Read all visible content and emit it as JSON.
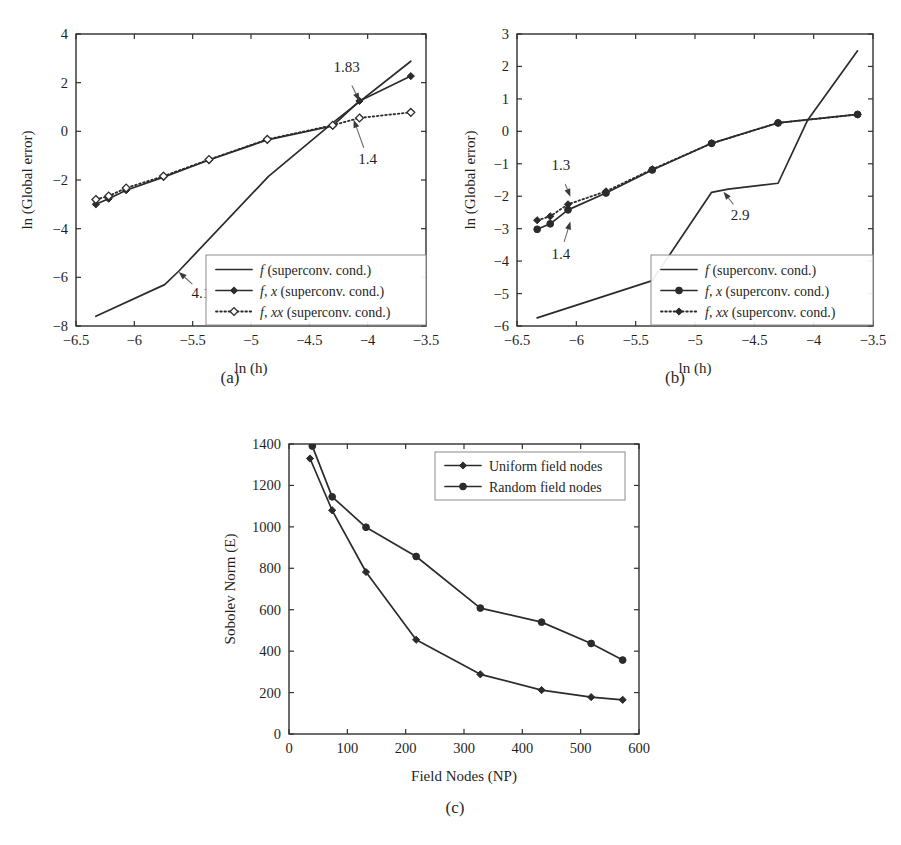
{
  "figure": {
    "captions": {
      "a": "(a)",
      "b": "(b)",
      "c": "(c)"
    }
  },
  "chart_data": [
    {
      "id": "a",
      "type": "line",
      "title": "",
      "caption": "(a)",
      "xlabel": "ln (h)",
      "ylabel": "ln (Global error)",
      "xlim": [
        -6.5,
        -3.5
      ],
      "ylim": [
        -8,
        4
      ],
      "xticks": [
        -6.5,
        -6,
        -5.5,
        -5,
        -4.5,
        -4,
        -3.5
      ],
      "xticklabels": [
        "−6.5",
        "−6",
        "−5.5",
        "−5",
        "−4.5",
        "−4",
        "−3.5"
      ],
      "yticks": [
        -8,
        -6,
        -4,
        -2,
        0,
        2,
        4
      ],
      "yticklabels": [
        "−8",
        "−6",
        "−4",
        "−2",
        "0",
        "2",
        "4"
      ],
      "grid": false,
      "legend_position": "lower right",
      "series": [
        {
          "name": "f (superconv. cond.)",
          "name_parts": {
            "italic": "f",
            "rest": " (superconv. cond.)"
          },
          "style": "solid",
          "marker": "none",
          "x": [
            -6.33,
            -5.74,
            -5.62,
            -4.85,
            -4.3,
            -3.63
          ],
          "y": [
            -7.6,
            -6.3,
            -5.75,
            -1.85,
            0.35,
            2.88
          ]
        },
        {
          "name": "f, x (superconv. cond.)",
          "name_parts": {
            "italic": "f",
            "mid": ", ",
            "italic2": "x",
            "rest": " (superconv. cond.)"
          },
          "style": "solid",
          "marker": "filled-diamond",
          "x": [
            -6.33,
            -6.22,
            -6.07,
            -5.75,
            -5.36,
            -4.86,
            -4.3,
            -4.07,
            -3.63
          ],
          "y": [
            -3.0,
            -2.77,
            -2.42,
            -1.88,
            -1.18,
            -0.35,
            0.22,
            1.25,
            2.27
          ]
        },
        {
          "name": "f, xx (superconv. cond.)",
          "name_parts": {
            "italic": "f",
            "mid": ", ",
            "italic2": "xx",
            "rest": " (superconv. cond.)"
          },
          "style": "dotted",
          "marker": "open-diamond",
          "x": [
            -6.33,
            -6.22,
            -6.07,
            -5.75,
            -5.36,
            -4.86,
            -4.3,
            -4.07,
            -3.63
          ],
          "y": [
            -2.8,
            -2.66,
            -2.33,
            -1.84,
            -1.16,
            -0.33,
            0.25,
            0.55,
            0.78
          ]
        }
      ],
      "annotations": [
        {
          "label": "1.83",
          "text_x": -4.18,
          "text_y": 2.45,
          "point_x": -4.07,
          "point_y": 1.25
        },
        {
          "label": "1.4",
          "text_x": -4.0,
          "text_y": -1.35,
          "point_x": -4.12,
          "point_y": 0.48
        },
        {
          "label": "4.1",
          "text_x": -5.43,
          "text_y": -6.85,
          "point_x": -5.62,
          "point_y": -5.78
        }
      ]
    },
    {
      "id": "b",
      "type": "line",
      "title": "",
      "caption": "(b)",
      "xlabel": "ln (h)",
      "ylabel": "ln (Global error)",
      "xlim": [
        -6.5,
        -3.5
      ],
      "ylim": [
        -6,
        3
      ],
      "xticks": [
        -6.5,
        -6,
        -5.5,
        -5,
        -4.5,
        -4,
        -3.5
      ],
      "xticklabels": [
        "−6.5",
        "−6",
        "−5.5",
        "−5",
        "−4.5",
        "−4",
        "−3.5"
      ],
      "yticks": [
        -6,
        -5,
        -4,
        -3,
        -2,
        -1,
        0,
        1,
        2,
        3
      ],
      "yticklabels": [
        "−6",
        "−5",
        "−4",
        "−3",
        "−2",
        "−1",
        "0",
        "1",
        "2",
        "3"
      ],
      "grid": false,
      "legend_position": "lower right",
      "series": [
        {
          "name": "f (superconv. cond.)",
          "name_parts": {
            "italic": "f",
            "rest": " (superconv. cond.)"
          },
          "style": "solid",
          "marker": "none",
          "x": [
            -6.33,
            -5.36,
            -4.86,
            -4.72,
            -4.3,
            -4.05,
            -3.63
          ],
          "y": [
            -5.75,
            -4.6,
            -1.88,
            -1.78,
            -1.6,
            0.35,
            2.48
          ]
        },
        {
          "name": "f, x (superconv. cond.)",
          "name_parts": {
            "italic": "f",
            "mid": ", ",
            "italic2": "x",
            "rest": " (superconv. cond.)"
          },
          "style": "solid",
          "marker": "filled-circle",
          "x": [
            -6.33,
            -6.22,
            -6.07,
            -5.75,
            -5.36,
            -4.86,
            -4.3,
            -3.63
          ],
          "y": [
            -3.02,
            -2.85,
            -2.42,
            -1.9,
            -1.19,
            -0.37,
            0.26,
            0.52
          ]
        },
        {
          "name": "f, xx (superconv. cond.)",
          "name_parts": {
            "italic": "f",
            "mid": ", ",
            "italic2": "xx",
            "rest": " (superconv. cond.)"
          },
          "style": "dotted",
          "marker": "filled-diamond",
          "x": [
            -6.33,
            -6.22,
            -6.07,
            -5.75,
            -5.36,
            -4.86,
            -4.3,
            -3.63
          ],
          "y": [
            -2.74,
            -2.62,
            -2.25,
            -1.85,
            -1.17,
            -0.37,
            0.26,
            0.52
          ]
        }
      ],
      "annotations": [
        {
          "label": "1.3",
          "text_x": -6.13,
          "text_y": -1.18,
          "point_x": -6.05,
          "point_y": -2.02
        },
        {
          "label": "1.4",
          "text_x": -6.13,
          "text_y": -3.92,
          "point_x": -6.05,
          "point_y": -2.78
        },
        {
          "label": "2.9",
          "text_x": -4.62,
          "text_y": -2.72,
          "point_x": -4.76,
          "point_y": -1.86
        }
      ]
    },
    {
      "id": "c",
      "type": "line",
      "title": "",
      "caption": "(c)",
      "xlabel": "Field Nodes (NP)",
      "ylabel": "Sobolev Norm (E)",
      "xlim": [
        0,
        600
      ],
      "ylim": [
        0,
        1400
      ],
      "xticks": [
        0,
        100,
        200,
        300,
        400,
        500,
        600
      ],
      "xticklabels": [
        "0",
        "100",
        "200",
        "300",
        "400",
        "500",
        "600"
      ],
      "yticks": [
        0,
        200,
        400,
        600,
        800,
        1000,
        1200,
        1400
      ],
      "yticklabels": [
        "0",
        "200",
        "400",
        "600",
        "800",
        "1000",
        "1200",
        "1400"
      ],
      "grid": false,
      "legend_position": "upper right",
      "series": [
        {
          "name": "Uniform field nodes",
          "style": "solid",
          "marker": "filled-diamond",
          "x": [
            36,
            74,
            132,
            218,
            328,
            433,
            518,
            572
          ],
          "y": [
            1330,
            1080,
            782,
            455,
            288,
            212,
            178,
            165
          ]
        },
        {
          "name": "Random field nodes",
          "style": "solid",
          "marker": "filled-circle",
          "x": [
            40,
            74,
            132,
            218,
            328,
            433,
            518,
            572
          ],
          "y": [
            1390,
            1145,
            998,
            857,
            608,
            540,
            437,
            357
          ]
        }
      ],
      "annotations": []
    }
  ]
}
